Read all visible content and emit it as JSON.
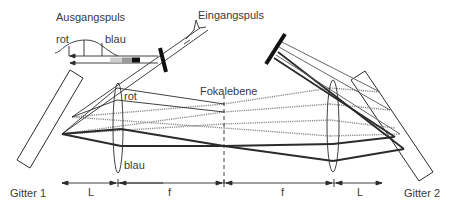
{
  "diagram": {
    "labels": {
      "output_pulse": "Ausgangspuls",
      "input_pulse": "Eingangspuls",
      "focal_plane": "Fokalebene",
      "red_pulse": "rot",
      "blue_pulse": "blau",
      "red_lens": "rot",
      "blue_lens": "blau",
      "grating_1": "Gitter 1",
      "grating_2": "Gitter 2",
      "dim_L_left": "L",
      "dim_f_left": "f",
      "dim_f_right": "f",
      "dim_L_right": "L"
    },
    "colors": {
      "line": "#2b2b2b",
      "beam_thin": "#555555",
      "beam_dotted": "#8a8a8a",
      "text": "#3a3a3a"
    }
  }
}
